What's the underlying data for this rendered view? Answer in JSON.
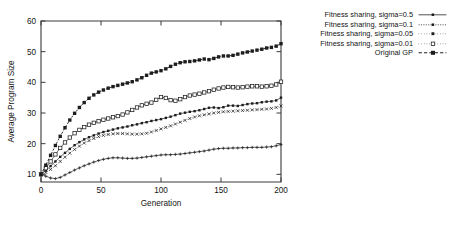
{
  "chart_data": {
    "type": "line",
    "title": "",
    "xlabel": "Generation",
    "ylabel": "Average Program Size",
    "xlim": [
      0,
      200
    ],
    "ylim": [
      7.5,
      60
    ],
    "xticks": [
      0,
      50,
      100,
      150,
      200
    ],
    "yticks": [
      10,
      20,
      30,
      40,
      50,
      60
    ],
    "grid": false,
    "legend_position": "right-top",
    "x": [
      0,
      4,
      8,
      12,
      16,
      20,
      24,
      28,
      32,
      36,
      40,
      44,
      48,
      52,
      56,
      60,
      64,
      68,
      72,
      76,
      80,
      84,
      88,
      92,
      96,
      100,
      104,
      108,
      112,
      116,
      120,
      124,
      128,
      132,
      136,
      140,
      144,
      148,
      152,
      156,
      160,
      164,
      168,
      172,
      176,
      180,
      184,
      188,
      192,
      196,
      200
    ],
    "series": [
      {
        "name": "Fitness sharing, sigma=0.5",
        "marker": "plus",
        "linestyle": "solid-thin",
        "values": [
          10.0,
          9.4,
          8.8,
          8.6,
          9.0,
          9.8,
          10.6,
          11.4,
          12.1,
          12.8,
          13.4,
          14.0,
          14.5,
          14.9,
          15.2,
          15.4,
          15.4,
          15.3,
          15.2,
          15.2,
          15.3,
          15.5,
          15.7,
          15.9,
          16.1,
          16.3,
          16.4,
          16.4,
          16.5,
          16.6,
          16.8,
          17.0,
          17.2,
          17.4,
          17.6,
          17.9,
          18.2,
          18.4,
          18.5,
          18.5,
          18.6,
          18.6,
          18.7,
          18.7,
          18.8,
          18.8,
          18.8,
          18.9,
          19.0,
          19.3,
          19.7
        ]
      },
      {
        "name": "Fitness sharing, sigma=0.1",
        "marker": "x-small",
        "linestyle": "dotted",
        "values": [
          10.0,
          10.6,
          11.6,
          12.8,
          14.2,
          15.6,
          16.9,
          18.1,
          19.2,
          20.2,
          21.0,
          21.7,
          22.3,
          22.7,
          23.0,
          23.2,
          23.3,
          23.3,
          23.2,
          23.1,
          23.1,
          23.2,
          23.4,
          23.8,
          24.3,
          24.8,
          25.3,
          25.8,
          26.4,
          27.0,
          27.6,
          28.2,
          28.7,
          29.1,
          29.4,
          29.7,
          30.0,
          30.2,
          30.4,
          30.5,
          30.6,
          30.7,
          30.8,
          30.9,
          31.0,
          31.1,
          31.2,
          31.3,
          31.5,
          31.8,
          32.3
        ]
      },
      {
        "name": "Fitness sharing, sigma=0.05",
        "marker": "filled-square-small",
        "linestyle": "solid-thin",
        "values": [
          10.0,
          11.2,
          12.7,
          14.2,
          15.7,
          17.0,
          18.3,
          19.5,
          20.5,
          21.4,
          22.1,
          22.7,
          23.3,
          23.8,
          24.2,
          24.6,
          25.0,
          25.3,
          25.6,
          26.0,
          26.3,
          26.7,
          27.0,
          27.4,
          27.7,
          28.0,
          28.4,
          28.8,
          29.3,
          29.8,
          30.1,
          30.4,
          30.6,
          30.9,
          31.3,
          31.7,
          31.8,
          31.6,
          31.9,
          32.4,
          32.4,
          32.3,
          32.6,
          32.9,
          33.1,
          33.2,
          33.5,
          33.7,
          33.8,
          34.1,
          35.0
        ]
      },
      {
        "name": "Fitness sharing, sigma=0.01",
        "marker": "open-square",
        "linestyle": "solid-thin",
        "values": [
          10.0,
          12.0,
          14.2,
          16.5,
          18.6,
          20.4,
          22.0,
          23.4,
          24.5,
          25.4,
          26.2,
          26.8,
          27.3,
          27.8,
          28.2,
          28.6,
          29.0,
          29.5,
          30.2,
          31.0,
          31.8,
          32.5,
          33.0,
          33.4,
          34.3,
          35.2,
          34.9,
          34.2,
          34.0,
          34.5,
          35.2,
          35.7,
          36.0,
          36.3,
          36.7,
          37.1,
          37.6,
          38.0,
          38.3,
          38.5,
          38.4,
          38.3,
          38.4,
          38.6,
          38.7,
          38.7,
          38.6,
          38.7,
          38.9,
          39.3,
          40.2
        ]
      },
      {
        "name": "Original GP",
        "marker": "filled-square",
        "linestyle": "dashed-bold",
        "values": [
          10.0,
          13.0,
          16.2,
          19.4,
          22.4,
          25.2,
          27.7,
          29.9,
          31.8,
          33.4,
          34.8,
          35.9,
          36.8,
          37.5,
          38.1,
          38.6,
          39.0,
          39.4,
          39.8,
          40.2,
          40.8,
          41.5,
          42.3,
          43.0,
          43.4,
          43.8,
          44.4,
          45.2,
          45.9,
          46.4,
          46.7,
          46.8,
          47.0,
          47.3,
          47.6,
          47.4,
          47.8,
          48.3,
          48.6,
          48.6,
          48.8,
          49.2,
          49.6,
          49.9,
          50.2,
          50.5,
          50.8,
          51.2,
          51.4,
          51.8,
          52.6
        ]
      }
    ]
  },
  "legend": {
    "entries": [
      {
        "label": "Fitness sharing, sigma=0.5"
      },
      {
        "label": "Fitness sharing, sigma=0.1"
      },
      {
        "label": "Fitness sharing, sigma=0.05"
      },
      {
        "label": "Fitness sharing, sigma=0.01"
      },
      {
        "label": "Original GP"
      }
    ]
  }
}
